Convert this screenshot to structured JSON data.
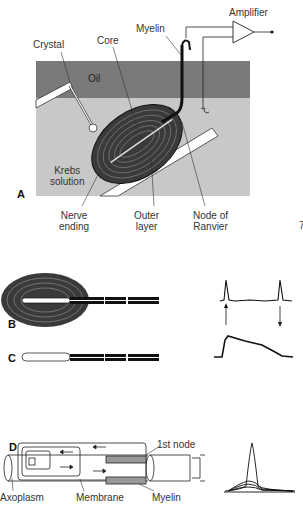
{
  "panels": {
    "A": {
      "letter": "A",
      "labels": {
        "amplifier": "Amplifier",
        "myelin": "Myelin",
        "crystal": "Crystal",
        "core": "Core",
        "oil": "Oil",
        "krebs_1": "Krebs",
        "krebs_2": "solution",
        "nerve_1": "Nerve",
        "nerve_2": "ending",
        "outer_1": "Outer",
        "outer_2": "layer",
        "node_1": "Node of",
        "node_2": "Ranvier"
      },
      "colors": {
        "oil": "#7a7a7a",
        "krebs": "#c8c8c8"
      }
    },
    "B": {
      "letter": "B"
    },
    "C": {
      "letter": "C"
    },
    "D": {
      "letter": "D",
      "labels": {
        "first_node": "1st node",
        "axoplasm": "Axoplasm",
        "membrane": "Membrane",
        "myelin": "Myelin"
      }
    },
    "edge_mark": "7"
  }
}
